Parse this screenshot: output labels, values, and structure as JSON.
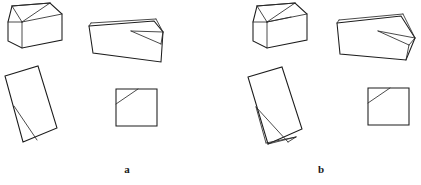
{
  "figure": {
    "kind": "line-drawing",
    "background_color": "#ffffff",
    "stroke_color": "#1c1c1c",
    "panels": [
      {
        "id": "a",
        "label": "a",
        "label_position": {
          "x": 127,
          "y": 170
        },
        "shapes": [
          {
            "id": "a-cube-top-left",
            "name": "cube-with-triangular-notch",
            "outline": "8,22 12,6 50,3 62,14 62,40 22,48 8,41",
            "internal_lines": [
              "12,6 22,22",
              "22,22 62,14",
              "22,22 22,48",
              "12,6 50,3",
              "22,22 50,3",
              "8,22 22,22"
            ]
          },
          {
            "id": "a-wedge-top-right",
            "name": "long-wedge-block",
            "outline": "89,26 154,21 163,32 161,62 93,53",
            "internal_lines": [
              "89,26 91,23",
              "91,23 156,19",
              "156,19 163,32",
              "131,31 161,44",
              "161,44 163,32",
              "131,31 163,32"
            ]
          },
          {
            "id": "a-tilted-rectangle",
            "name": "tilted-rectangle-with-fold",
            "outline": "5,76 38,66 57,128 23,142",
            "internal_lines": [
              "14,106 37,140"
            ]
          },
          {
            "id": "a-square-bottom-right",
            "name": "square-with-corner-diagonal",
            "outline": "116,89 157,89 157,126 116,126",
            "internal_lines": [
              "116,104 138,89"
            ]
          }
        ]
      },
      {
        "id": "b",
        "label": "b",
        "label_position": {
          "x": 320,
          "y": 170
        },
        "shapes": [
          {
            "id": "b-cube-top-left",
            "name": "cube-with-triangular-notch",
            "outline": "253,22 257,6 295,3 307,14 307,40 267,48 253,41",
            "internal_lines": [
              "257,6 267,22",
              "267,22 307,14",
              "267,22 267,48",
              "257,6 295,3",
              "267,22 295,3",
              "253,22 267,22",
              "267,22 291,17"
            ]
          },
          {
            "id": "b-wedge-top-right",
            "name": "long-wedge-block-with-flap",
            "outline": "337,23 401,16 415,38 406,60 340,54",
            "internal_lines": [
              "337,23 339,20",
              "339,20 403,14",
              "378,31 409,45",
              "378,31 415,38",
              "409,45 415,38",
              "403,14 415,38",
              "409,45 406,60"
            ]
          },
          {
            "id": "b-tilted-rectangle",
            "name": "tilted-rectangle-with-lower-flap",
            "outline": "248,77 282,67 302,129 268,144",
            "internal_lines": [
              "256,107 288,142",
              "256,107 266,143",
              "266,143 296,137",
              "288,142 296,137",
              "268,144 296,137"
            ]
          },
          {
            "id": "b-square-bottom-right",
            "name": "square-with-corner-diagonal",
            "outline": "368,88 409,88 409,125 368,125",
            "internal_lines": [
              "368,103 390,88"
            ]
          }
        ]
      }
    ]
  }
}
